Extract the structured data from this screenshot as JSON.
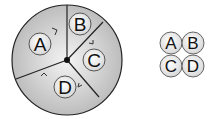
{
  "diagram": {
    "type": "divided-circle-with-legend",
    "main_circle": {
      "sections": [
        {
          "label": "A"
        },
        {
          "label": "B"
        },
        {
          "label": "C"
        },
        {
          "label": "D"
        }
      ],
      "arrows": [
        "arrow-near-A",
        "arrow-near-C",
        "arrow-near-D-left",
        "arrow-near-D-right"
      ]
    },
    "legend": {
      "tokens": [
        {
          "label": "A"
        },
        {
          "label": "B"
        },
        {
          "label": "C"
        },
        {
          "label": "D"
        }
      ]
    },
    "colors": {
      "fill": "#c8c8c8",
      "center_fill": "#f2f2f2",
      "stroke": "#222222",
      "token_fill": "#f4f4f4"
    }
  }
}
